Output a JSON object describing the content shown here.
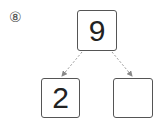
{
  "problem": {
    "number_label": "⑧",
    "whole": "9",
    "parts": [
      "2",
      ""
    ]
  },
  "colors": {
    "border": "#555555",
    "text": "#222222",
    "arrow": "#888888"
  }
}
